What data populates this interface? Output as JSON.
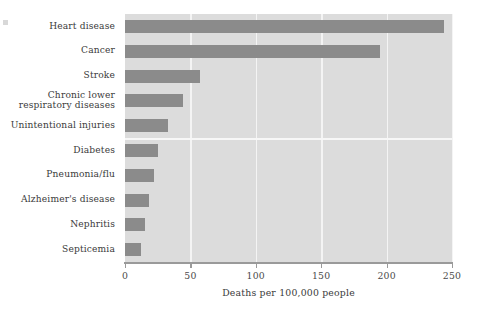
{
  "chart_data": {
    "type": "bar",
    "orientation": "horizontal",
    "title": "",
    "xlabel": "Deaths per 100,000 people",
    "ylabel": "",
    "xlim": [
      0,
      250
    ],
    "xticks": [
      "0",
      "50",
      "100",
      "150",
      "200",
      "250"
    ],
    "xtick_values": [
      0,
      50,
      100,
      150,
      200,
      250
    ],
    "grid": "vertical white gridlines at each x tick; one horizontal white gridline between 'Unintentional injuries' and 'Diabetes'",
    "legend": "none",
    "categories": [
      "Heart disease",
      "Cancer",
      "Stroke",
      "Chronic lower respiratory diseases",
      "Unintentional injuries",
      "Diabetes",
      "Pneumonia/flu",
      "Alzheimer's disease",
      "Nephritis",
      "Septicemia"
    ],
    "category_lines": [
      [
        "Heart disease"
      ],
      [
        "Cancer"
      ],
      [
        "Stroke"
      ],
      [
        "Chronic lower",
        "respiratory diseases"
      ],
      [
        "Unintentional injuries"
      ],
      [
        "Diabetes"
      ],
      [
        "Pneumonia/flu"
      ],
      [
        "Alzheimer's disease"
      ],
      [
        "Nephritis"
      ],
      [
        "Septicemia"
      ]
    ],
    "values": [
      244,
      195,
      57,
      44,
      33,
      25,
      22,
      18,
      15,
      12
    ],
    "colors": {
      "bar": "#8b8b8b",
      "plot_background": "#dcdcdc",
      "gridline": "#f4f4f4",
      "axis": "#9a9a9a",
      "text": "#3a3a3a",
      "page_background": "#ffffff"
    }
  }
}
